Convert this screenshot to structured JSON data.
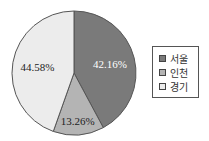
{
  "chart_data": {
    "type": "pie",
    "title": "",
    "start": "12 o'clock",
    "direction": "clockwise",
    "slices": [
      {
        "label": "서울",
        "value": 42.16,
        "display": "42.16%",
        "color": "#7a7a7a",
        "label_color": "#ffffff"
      },
      {
        "label": "인천",
        "value": 13.26,
        "display": "13.26%",
        "color": "#b4b4b4",
        "label_color": "#222222"
      },
      {
        "label": "경기",
        "value": 44.58,
        "display": "44.58%",
        "color": "#ececec",
        "label_color": "#222222"
      }
    ],
    "legend": {
      "placement": "right",
      "entries": [
        "서울",
        "인천",
        "경기"
      ]
    },
    "outline_color": "#555555"
  }
}
